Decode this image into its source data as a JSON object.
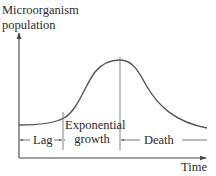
{
  "diagram": {
    "y_axis_label_line1": "Microorganism",
    "y_axis_label_line2": "population",
    "x_axis_label": "Time",
    "phases": [
      {
        "name": "Lag"
      },
      {
        "name_line1": "Exponential",
        "name_line2": "growth"
      },
      {
        "name": "Death"
      }
    ],
    "colors": {
      "line": "#555555",
      "axis": "#444444",
      "text": "#2a2a2a"
    }
  }
}
